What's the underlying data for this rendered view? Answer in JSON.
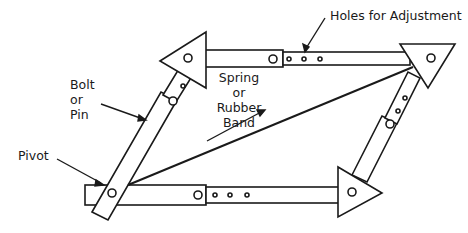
{
  "diagram": {
    "type": "linkage-mechanism",
    "stroke_color": "#1a1a1a",
    "fill_color": "#ffffff",
    "labels": {
      "holes": "Holes for Adjustment",
      "bolt": "Bolt\nor\nPin",
      "spring": "Spring\nor\nRubber\nBand",
      "pivot": "Pivot"
    },
    "parts": [
      {
        "name": "top-left-triangle",
        "points": "160,61 206,32 206,88"
      },
      {
        "name": "top-right-triangle",
        "points": "400,44 455,44 428,88"
      },
      {
        "name": "bottom-right-triangle",
        "points": "338,167 338,217 382,193"
      }
    ]
  }
}
